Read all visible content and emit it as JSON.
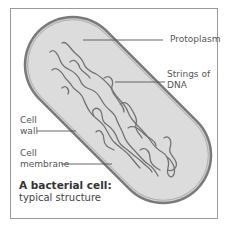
{
  "diagram": {
    "title": "A bacterial cell:",
    "subtitle": "typical structure",
    "labels": {
      "protoplasm": "Protoplasm",
      "dna_line1": "Strings of",
      "dna_line2": "DNA",
      "cell_wall_line1": "Cell",
      "cell_wall_line2": "wall",
      "membrane_line1": "Cell",
      "membrane_line2": "membrane"
    },
    "colors": {
      "cell_fill": "#dcdcdc",
      "cell_wall": "#6e6e6e",
      "membrane": "#8a8a8a",
      "dna": "#707070",
      "leader_lines": "#555555",
      "frame": "#9a9a9a"
    }
  }
}
